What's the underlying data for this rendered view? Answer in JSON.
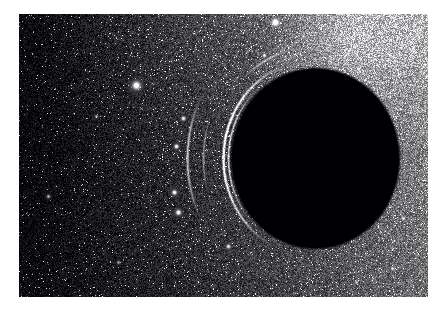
{
  "document": {
    "kind": "natural-image",
    "title": "Black hole shadow against dense star field",
    "background_color": "#ffffff",
    "canvas": {
      "width": 442,
      "height": 318
    }
  },
  "image": {
    "name": "black-hole-starfield-photograph",
    "alt_text": "Grayscale astronomical image: a large black circular shadow on the right of frame surrounded by a dense grainy star field that brightens toward the upper right.",
    "frame": {
      "x": 19,
      "y": 14,
      "width": 409,
      "height": 283
    },
    "palette": {
      "plate_black": "#000000",
      "deep_shadow": "#050507",
      "mid_gray": "#6a6a6e",
      "bright_gray": "#b9b9bd",
      "highlight_white": "#ffffff",
      "page_white": "#ffffff"
    },
    "colorspace": "grayscale",
    "texture": {
      "type": "dense-star-noise",
      "grain_strength": 0.55,
      "star_density": 0.07
    },
    "background_field": {
      "description": "Dense speckled star field, brightness increases toward the upper-right and right edge, falls to near-black at the left and lower-left.",
      "gradient_stops": [
        {
          "x": 0.0,
          "y": 0.0,
          "luminance": 0.06
        },
        {
          "x": 0.55,
          "y": 0.0,
          "luminance": 0.62
        },
        {
          "x": 1.0,
          "y": 0.0,
          "luminance": 0.72
        },
        {
          "x": 0.0,
          "y": 0.5,
          "luminance": 0.04
        },
        {
          "x": 1.0,
          "y": 0.5,
          "luminance": 0.48
        },
        {
          "x": 0.0,
          "y": 1.0,
          "luminance": 0.05
        },
        {
          "x": 0.55,
          "y": 1.0,
          "luminance": 0.34
        },
        {
          "x": 1.0,
          "y": 1.0,
          "luminance": 0.42
        }
      ]
    },
    "features": [
      {
        "name": "black-hole-shadow-disk",
        "shape": "ellipse",
        "center_x": 315,
        "center_y": 158,
        "radius_x": 83,
        "radius_y": 89,
        "fill": "#000000",
        "note": "Pure black silhouette occupying the right-center of the plate."
      },
      {
        "name": "photon-ring-arc-outer",
        "shape": "arc",
        "center_x": 315,
        "center_y": 158,
        "radius": 92,
        "start_deg": 110,
        "end_deg": 265,
        "thickness": 3,
        "luminance": 0.78,
        "note": "Bright thin rim hugging the upper-left through lower-left limb of the disk."
      },
      {
        "name": "photon-ring-arc-inner",
        "shape": "arc",
        "center_x": 315,
        "center_y": 158,
        "radius": 87,
        "start_deg": 130,
        "end_deg": 240,
        "thickness": 2,
        "luminance": 0.55
      },
      {
        "name": "lensing-arc-far-left",
        "shape": "arc",
        "center_x": 315,
        "center_y": 158,
        "radius": 128,
        "start_deg": 150,
        "end_deg": 212,
        "thickness": 3,
        "luminance": 0.5,
        "note": "Detached curved filament of gravitationally lensed light to the left of the shadow."
      },
      {
        "name": "lensing-arc-mid-left",
        "shape": "arc",
        "center_x": 315,
        "center_y": 158,
        "radius": 112,
        "start_deg": 160,
        "end_deg": 205,
        "thickness": 2,
        "luminance": 0.38
      },
      {
        "name": "lower-left-wisp",
        "shape": "arc",
        "center_x": 315,
        "center_y": 158,
        "radius": 104,
        "start_deg": 222,
        "end_deg": 262,
        "thickness": 4,
        "luminance": 0.46
      },
      {
        "name": "bright-halo-upper-right",
        "shape": "radial-glow",
        "center_x": 352,
        "center_y": 42,
        "radius": 110,
        "luminance": 0.7
      }
    ],
    "stars": [
      {
        "name": "bright-star-top",
        "x": 275,
        "y": 22,
        "radius": 4.2,
        "luminance": 1.0
      },
      {
        "name": "bright-star-left",
        "x": 136,
        "y": 85,
        "radius": 3.8,
        "luminance": 1.0
      },
      {
        "name": "star-upper-mid",
        "x": 264,
        "y": 55,
        "radius": 2.0,
        "luminance": 0.88
      },
      {
        "name": "star-upper-right",
        "x": 303,
        "y": 36,
        "radius": 1.8,
        "luminance": 0.82
      },
      {
        "name": "star-arc-node-a",
        "x": 183,
        "y": 118,
        "radius": 2.2,
        "luminance": 0.85
      },
      {
        "name": "star-arc-node-b",
        "x": 176,
        "y": 146,
        "radius": 2.2,
        "luminance": 0.9
      },
      {
        "name": "star-lower-left-a",
        "x": 174,
        "y": 192,
        "radius": 2.4,
        "luminance": 0.88
      },
      {
        "name": "star-lower-left-b",
        "x": 178,
        "y": 212,
        "radius": 2.6,
        "luminance": 0.92
      },
      {
        "name": "star-bottom-mid",
        "x": 228,
        "y": 246,
        "radius": 2.2,
        "luminance": 0.8
      },
      {
        "name": "star-right-low",
        "x": 403,
        "y": 218,
        "radius": 2.2,
        "luminance": 0.82
      },
      {
        "name": "star-right-lower",
        "x": 392,
        "y": 268,
        "radius": 2.0,
        "luminance": 0.78
      },
      {
        "name": "star-far-left",
        "x": 48,
        "y": 196,
        "radius": 1.6,
        "luminance": 0.62
      },
      {
        "name": "star-left-mid",
        "x": 96,
        "y": 116,
        "radius": 1.5,
        "luminance": 0.6
      },
      {
        "name": "star-left-low",
        "x": 118,
        "y": 262,
        "radius": 1.5,
        "luminance": 0.58
      },
      {
        "name": "star-bottom-right",
        "x": 356,
        "y": 282,
        "radius": 1.8,
        "luminance": 0.7
      }
    ]
  },
  "caption": {
    "text": ""
  }
}
